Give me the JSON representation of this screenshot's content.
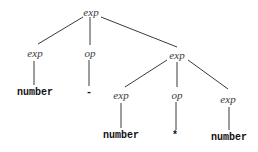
{
  "diagram": {
    "type": "parse-tree",
    "nodes": [
      {
        "id": "n0",
        "label": "exp",
        "kind": "nonterminal",
        "x": 91,
        "y": 12
      },
      {
        "id": "n1",
        "label": "exp",
        "kind": "nonterminal",
        "x": 35,
        "y": 53
      },
      {
        "id": "n2",
        "label": "op",
        "kind": "nonterminal",
        "x": 90,
        "y": 53
      },
      {
        "id": "n3",
        "label": "exp",
        "kind": "nonterminal",
        "x": 177,
        "y": 55
      },
      {
        "id": "n4",
        "label": "number",
        "kind": "terminal",
        "x": 35,
        "y": 93
      },
      {
        "id": "n5",
        "label": "-",
        "kind": "terminal",
        "x": 89,
        "y": 93
      },
      {
        "id": "n6",
        "label": "exp",
        "kind": "nonterminal",
        "x": 121,
        "y": 95
      },
      {
        "id": "n7",
        "label": "op",
        "kind": "nonterminal",
        "x": 177,
        "y": 95
      },
      {
        "id": "n8",
        "label": "exp",
        "kind": "nonterminal",
        "x": 228,
        "y": 99
      },
      {
        "id": "n9",
        "label": "number",
        "kind": "terminal",
        "x": 121,
        "y": 136
      },
      {
        "id": "n10",
        "label": "*",
        "kind": "terminal",
        "x": 175,
        "y": 136
      },
      {
        "id": "n11",
        "label": "number",
        "kind": "terminal",
        "x": 229,
        "y": 138
      }
    ],
    "edges": [
      {
        "from": "n0",
        "to": "n1",
        "x1": 83,
        "y1": 17,
        "x2": 38,
        "y2": 44
      },
      {
        "from": "n0",
        "to": "n2",
        "x1": 90,
        "y1": 17,
        "x2": 90,
        "y2": 45
      },
      {
        "from": "n0",
        "to": "n3",
        "x1": 101,
        "y1": 17,
        "x2": 177,
        "y2": 47
      },
      {
        "from": "n1",
        "to": "n4",
        "x1": 34,
        "y1": 61,
        "x2": 34,
        "y2": 85
      },
      {
        "from": "n2",
        "to": "n5",
        "x1": 89,
        "y1": 60,
        "x2": 89,
        "y2": 86
      },
      {
        "from": "n3",
        "to": "n6",
        "x1": 167,
        "y1": 60,
        "x2": 125,
        "y2": 87
      },
      {
        "from": "n3",
        "to": "n7",
        "x1": 177,
        "y1": 62,
        "x2": 177,
        "y2": 87
      },
      {
        "from": "n3",
        "to": "n8",
        "x1": 188,
        "y1": 60,
        "x2": 228,
        "y2": 89
      },
      {
        "from": "n6",
        "to": "n9",
        "x1": 121,
        "y1": 103,
        "x2": 121,
        "y2": 128
      },
      {
        "from": "n7",
        "to": "n10",
        "x1": 176,
        "y1": 102,
        "x2": 176,
        "y2": 130
      },
      {
        "from": "n8",
        "to": "n11",
        "x1": 229,
        "y1": 107,
        "x2": 229,
        "y2": 130
      }
    ]
  },
  "labels": {
    "root": "exp",
    "l1_exp": "exp",
    "l1_op": "op",
    "l1_exp_right": "exp",
    "l2_number": "number",
    "l2_minus": "-",
    "l2_exp": "exp",
    "l2_op": "op",
    "l2_exp_right": "exp",
    "l3_number": "number",
    "l3_times": "*",
    "l3_number_right": "number"
  },
  "colors": {
    "line": "#3a3a3a",
    "nonterminal_text": "#3a3a3a",
    "terminal_text": "#111111",
    "background": "#ffffff"
  }
}
